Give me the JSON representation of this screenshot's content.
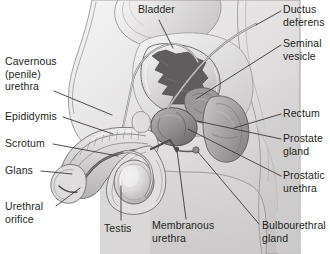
{
  "figure": {
    "width": 330,
    "height": 254,
    "background_color": "#ffffff",
    "style": "grayscale medical illustration with leader-line callout labels",
    "text_color": "#231f20",
    "leader_color": "#3a3a3a"
  },
  "labels": [
    {
      "id": "bladder",
      "text": "Bladder",
      "x": 138,
      "y": 4,
      "side": "center",
      "leader": [
        [
          157,
          19
        ],
        [
          172,
          47
        ]
      ]
    },
    {
      "id": "ductus-deferens",
      "text": "Ductus\ndeferens",
      "x": 283,
      "y": 4,
      "side": "right",
      "leader": [
        [
          280,
          11
        ],
        [
          258,
          23
        ]
      ]
    },
    {
      "id": "seminal-vesicle",
      "text": "Seminal\nvesicle",
      "x": 283,
      "y": 38,
      "side": "right",
      "leader": [
        [
          280,
          45
        ],
        [
          193,
          98
        ]
      ]
    },
    {
      "id": "rectum",
      "text": "Rectum",
      "x": 283,
      "y": 107,
      "side": "right",
      "leader": [
        [
          280,
          114
        ],
        [
          232,
          128
        ]
      ]
    },
    {
      "id": "prostate-gland",
      "text": "Prostate\ngland",
      "x": 283,
      "y": 132,
      "side": "right",
      "leader": [
        [
          280,
          139
        ],
        [
          196,
          122
        ]
      ]
    },
    {
      "id": "prostatic-urethra",
      "text": "Prostatic\nurethra",
      "x": 283,
      "y": 169,
      "side": "right",
      "leader": [
        [
          280,
          176
        ],
        [
          186,
          128
        ]
      ]
    },
    {
      "id": "bulbourethral-gland",
      "text": "Bulbourethral\ngland",
      "x": 262,
      "y": 222,
      "side": "right",
      "leader": [
        [
          260,
          226
        ],
        [
          197,
          150
        ]
      ]
    },
    {
      "id": "membranous-urethra",
      "text": "Membranous\nurethra",
      "x": 152,
      "y": 222,
      "side": "center",
      "leader": [
        [
          186,
          220
        ],
        [
          176,
          148
        ]
      ]
    },
    {
      "id": "testis",
      "text": "Testis",
      "x": 105,
      "y": 224,
      "side": "center",
      "leader": [
        [
          120,
          220
        ],
        [
          120,
          184
        ]
      ]
    },
    {
      "id": "urethral-orifice",
      "text": "Urethral\norifice",
      "x": 5,
      "y": 202,
      "side": "left",
      "leader": [
        [
          57,
          206
        ],
        [
          81,
          186
        ]
      ]
    },
    {
      "id": "glans",
      "text": "Glans",
      "x": 5,
      "y": 166,
      "side": "left",
      "leader": [
        [
          42,
          171
        ],
        [
          74,
          171
        ]
      ]
    },
    {
      "id": "scrotum",
      "text": "Scrotum",
      "x": 5,
      "y": 139,
      "side": "left",
      "leader": [
        [
          54,
          144
        ],
        [
          118,
          155
        ]
      ]
    },
    {
      "id": "epididymis",
      "text": "Epididymis",
      "x": 5,
      "y": 112,
      "side": "left",
      "leader": [
        [
          64,
          117
        ],
        [
          112,
          133
        ]
      ]
    },
    {
      "id": "cavernous-urethra",
      "text": "Cavernous\n(penile)\nurethra",
      "x": 5,
      "y": 57,
      "side": "left",
      "leader": [
        [
          55,
          91
        ],
        [
          112,
          114
        ]
      ]
    }
  ],
  "anatomy_regions": [
    {
      "id": "abdominal-wall",
      "name": "Abdominal wall / pubic region"
    },
    {
      "id": "bladder-body",
      "name": "Urinary bladder with rugose interior"
    },
    {
      "id": "rectum-body",
      "name": "Rectum"
    },
    {
      "id": "prostate-body",
      "name": "Prostate gland"
    },
    {
      "id": "seminal-vesicle-body",
      "name": "Seminal vesicle"
    },
    {
      "id": "ductus-deferens-cord",
      "name": "Ductus deferens cord"
    },
    {
      "id": "penis-shaft",
      "name": "Penis shaft with corpora cavernosa"
    },
    {
      "id": "glans-body",
      "name": "Glans penis"
    },
    {
      "id": "scrotum-sac",
      "name": "Scrotum"
    },
    {
      "id": "testis-body",
      "name": "Testis"
    },
    {
      "id": "epididymis-body",
      "name": "Epididymis"
    },
    {
      "id": "thigh-block",
      "name": "Upper thigh shading block"
    }
  ],
  "palette": {
    "paper": "#ffffff",
    "skin_light": "#eceaea",
    "skin_mid": "#d6d4d4",
    "skin_dark": "#b9b7b7",
    "organ_mid": "#a9a7a7",
    "organ_dark": "#7e7c7c",
    "organ_darkest": "#585656",
    "outline": "#5a5858",
    "highlight": "#f6f5f5"
  }
}
